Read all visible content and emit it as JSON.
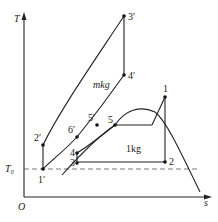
{
  "diagram": {
    "type": "T-s diagram (cascade refrigeration cycle)",
    "axes": {
      "y_label": "T",
      "x_label": "s",
      "origin_label": "O",
      "reference_line_label": "T₀"
    },
    "regions": {
      "upper_cycle_label": "mkg",
      "lower_cycle_label": "1kg"
    },
    "points": [
      {
        "id": "1",
        "label": "1"
      },
      {
        "id": "2",
        "label": "2"
      },
      {
        "id": "3",
        "label": "3"
      },
      {
        "id": "4",
        "label": "4"
      },
      {
        "id": "5",
        "label": "5"
      },
      {
        "id": "1p",
        "label": "1′"
      },
      {
        "id": "2p",
        "label": "2′"
      },
      {
        "id": "3p",
        "label": "3′"
      },
      {
        "id": "4p",
        "label": "4′"
      },
      {
        "id": "5p",
        "label": "5′"
      },
      {
        "id": "6p",
        "label": "6′"
      }
    ]
  }
}
